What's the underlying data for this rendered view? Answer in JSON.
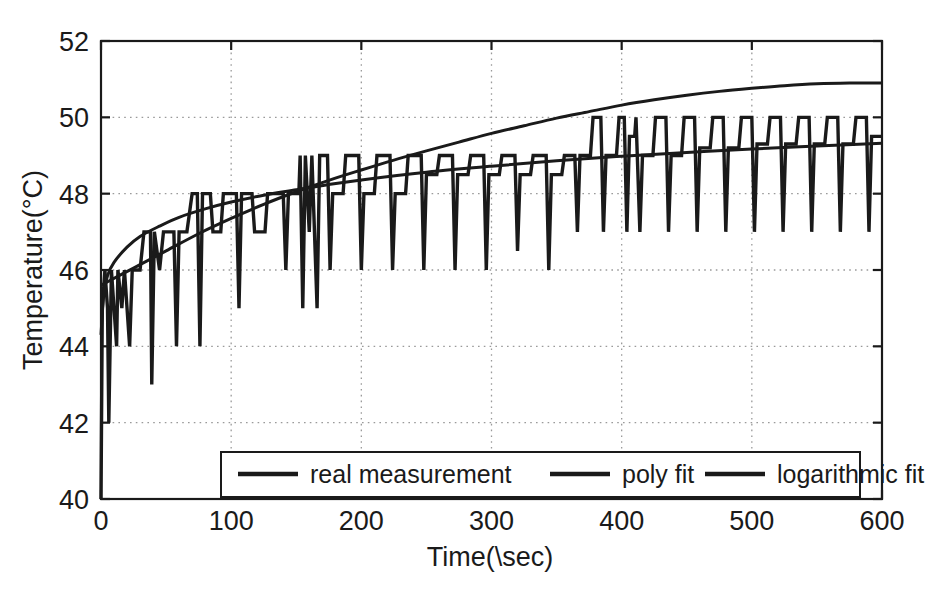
{
  "chart_data": {
    "type": "line",
    "title": "",
    "xlabel": "Time(\\sec)",
    "ylabel": "Temperature(°C)",
    "xlim": [
      0,
      600
    ],
    "ylim": [
      40,
      52
    ],
    "xticks": [
      0,
      100,
      200,
      300,
      400,
      500,
      600
    ],
    "yticks": [
      40,
      42,
      44,
      46,
      48,
      50,
      52
    ],
    "xtick_labels": [
      "0",
      "100",
      "200",
      "300",
      "400",
      "500",
      "600"
    ],
    "ytick_labels": [
      "40",
      "42",
      "44",
      "46",
      "48",
      "50",
      "52"
    ],
    "grid": true,
    "grid_style": "dotted",
    "legend_position": "lower center",
    "line_color": "#1a1a1a",
    "background": "#ffffff",
    "series": [
      {
        "name": "real measurement",
        "style": "square-wave with downward spikes",
        "points": [
          [
            0,
            40.0
          ],
          [
            1,
            45.0
          ],
          [
            3,
            46.0
          ],
          [
            5,
            45.0
          ],
          [
            6,
            42.0
          ],
          [
            8,
            46.0
          ],
          [
            12,
            44.0
          ],
          [
            13,
            46.0
          ],
          [
            16,
            45.0
          ],
          [
            18,
            46.0
          ],
          [
            22,
            44.0
          ],
          [
            24,
            46.0
          ],
          [
            30,
            46.0
          ],
          [
            33,
            47.0
          ],
          [
            38,
            47.0
          ],
          [
            39,
            43.0
          ],
          [
            41,
            47.0
          ],
          [
            45,
            46.0
          ],
          [
            48,
            47.0
          ],
          [
            56,
            47.0
          ],
          [
            58,
            44.0
          ],
          [
            60,
            47.0
          ],
          [
            66,
            47.0
          ],
          [
            70,
            48.0
          ],
          [
            74,
            48.0
          ],
          [
            76,
            44.0
          ],
          [
            78,
            48.0
          ],
          [
            84,
            48.0
          ],
          [
            86,
            47.0
          ],
          [
            92,
            47.0
          ],
          [
            94,
            48.0
          ],
          [
            104,
            48.0
          ],
          [
            106,
            45.0
          ],
          [
            108,
            48.0
          ],
          [
            116,
            48.0
          ],
          [
            118,
            47.0
          ],
          [
            126,
            47.0
          ],
          [
            128,
            48.0
          ],
          [
            140,
            48.0
          ],
          [
            142,
            46.0
          ],
          [
            144,
            48.0
          ],
          [
            152,
            48.0
          ],
          [
            153,
            49.0
          ],
          [
            155,
            45.0
          ],
          [
            157,
            49.0
          ],
          [
            160,
            47.0
          ],
          [
            162,
            49.0
          ],
          [
            166,
            45.0
          ],
          [
            168,
            49.0
          ],
          [
            174,
            49.0
          ],
          [
            176,
            46.0
          ],
          [
            178,
            48.0
          ],
          [
            186,
            48.0
          ],
          [
            188,
            49.0
          ],
          [
            198,
            49.0
          ],
          [
            200,
            46.0
          ],
          [
            202,
            48.0
          ],
          [
            210,
            48.0
          ],
          [
            212,
            49.0
          ],
          [
            222,
            49.0
          ],
          [
            224,
            46.0
          ],
          [
            226,
            48.0
          ],
          [
            234,
            48.0
          ],
          [
            236,
            49.0
          ],
          [
            246,
            49.0
          ],
          [
            248,
            46.0
          ],
          [
            250,
            48.5
          ],
          [
            258,
            48.5
          ],
          [
            260,
            49.0
          ],
          [
            270,
            49.0
          ],
          [
            272,
            46.0
          ],
          [
            274,
            48.5
          ],
          [
            282,
            48.5
          ],
          [
            284,
            49.0
          ],
          [
            294,
            49.0
          ],
          [
            296,
            46.0
          ],
          [
            298,
            48.5
          ],
          [
            306,
            48.5
          ],
          [
            308,
            49.0
          ],
          [
            318,
            49.0
          ],
          [
            320,
            46.5
          ],
          [
            322,
            48.5
          ],
          [
            330,
            48.5
          ],
          [
            332,
            49.0
          ],
          [
            342,
            49.0
          ],
          [
            344,
            46.0
          ],
          [
            346,
            48.5
          ],
          [
            354,
            48.5
          ],
          [
            356,
            49.0
          ],
          [
            364,
            49.0
          ],
          [
            366,
            47.0
          ],
          [
            368,
            49.0
          ],
          [
            376,
            49.0
          ],
          [
            378,
            50.0
          ],
          [
            384,
            50.0
          ],
          [
            386,
            47.0
          ],
          [
            388,
            49.0
          ],
          [
            396,
            49.0
          ],
          [
            398,
            50.0
          ],
          [
            402,
            50.0
          ],
          [
            404,
            47.0
          ],
          [
            406,
            49.5
          ],
          [
            410,
            49.5
          ],
          [
            411,
            50.0
          ],
          [
            414,
            47.0
          ],
          [
            416,
            49.0
          ],
          [
            424,
            49.0
          ],
          [
            426,
            50.0
          ],
          [
            434,
            50.0
          ],
          [
            436,
            47.0
          ],
          [
            438,
            49.0
          ],
          [
            446,
            49.0
          ],
          [
            448,
            50.0
          ],
          [
            456,
            50.0
          ],
          [
            458,
            47.0
          ],
          [
            460,
            49.2
          ],
          [
            468,
            49.2
          ],
          [
            470,
            50.0
          ],
          [
            478,
            50.0
          ],
          [
            480,
            47.0
          ],
          [
            482,
            49.2
          ],
          [
            490,
            49.2
          ],
          [
            492,
            50.0
          ],
          [
            500,
            50.0
          ],
          [
            502,
            47.0
          ],
          [
            504,
            49.3
          ],
          [
            512,
            49.3
          ],
          [
            514,
            50.0
          ],
          [
            522,
            50.0
          ],
          [
            524,
            47.0
          ],
          [
            526,
            49.3
          ],
          [
            534,
            49.3
          ],
          [
            536,
            50.0
          ],
          [
            544,
            50.0
          ],
          [
            546,
            47.0
          ],
          [
            548,
            49.3
          ],
          [
            556,
            49.3
          ],
          [
            558,
            50.0
          ],
          [
            566,
            50.0
          ],
          [
            568,
            47.0
          ],
          [
            570,
            49.3
          ],
          [
            578,
            49.3
          ],
          [
            580,
            50.0
          ],
          [
            588,
            50.0
          ],
          [
            590,
            47.0
          ],
          [
            592,
            49.5
          ],
          [
            600,
            49.5
          ]
        ]
      },
      {
        "name": "poly fit",
        "style": "smooth polynomial curve",
        "points": [
          [
            0,
            45.6
          ],
          [
            25,
            46.05
          ],
          [
            50,
            46.5
          ],
          [
            75,
            46.95
          ],
          [
            100,
            47.35
          ],
          [
            125,
            47.72
          ],
          [
            150,
            48.05
          ],
          [
            175,
            48.35
          ],
          [
            200,
            48.62
          ],
          [
            225,
            48.88
          ],
          [
            250,
            49.12
          ],
          [
            275,
            49.35
          ],
          [
            300,
            49.58
          ],
          [
            325,
            49.78
          ],
          [
            350,
            49.98
          ],
          [
            375,
            50.15
          ],
          [
            400,
            50.32
          ],
          [
            425,
            50.46
          ],
          [
            450,
            50.58
          ],
          [
            475,
            50.68
          ],
          [
            500,
            50.76
          ],
          [
            525,
            50.83
          ],
          [
            550,
            50.88
          ],
          [
            575,
            50.9
          ],
          [
            600,
            50.9
          ]
        ]
      },
      {
        "name": "logarithmic fit",
        "style": "logarithmic curve",
        "points": [
          [
            0,
            44.3
          ],
          [
            2,
            45.3
          ],
          [
            5,
            45.85
          ],
          [
            10,
            46.2
          ],
          [
            20,
            46.6
          ],
          [
            30,
            46.88
          ],
          [
            45,
            47.15
          ],
          [
            60,
            47.38
          ],
          [
            80,
            47.6
          ],
          [
            100,
            47.78
          ],
          [
            125,
            47.96
          ],
          [
            150,
            48.1
          ],
          [
            175,
            48.24
          ],
          [
            200,
            48.36
          ],
          [
            250,
            48.56
          ],
          [
            300,
            48.72
          ],
          [
            350,
            48.86
          ],
          [
            400,
            48.98
          ],
          [
            450,
            49.08
          ],
          [
            500,
            49.17
          ],
          [
            550,
            49.25
          ],
          [
            600,
            49.32
          ]
        ]
      }
    ],
    "legend_entries": [
      "real measurement",
      "poly fit",
      "logarithmic fit"
    ]
  },
  "legend": {
    "items": [
      {
        "label": "real measurement"
      },
      {
        "label": "poly fit"
      },
      {
        "label": "logarithmic fit"
      }
    ]
  },
  "axes": {
    "x_label": "Time(\\sec)",
    "y_label": "Temperature(°C)",
    "x_tick_labels": [
      "0",
      "100",
      "200",
      "300",
      "400",
      "500",
      "600"
    ],
    "y_tick_labels": [
      "40",
      "42",
      "44",
      "46",
      "48",
      "50",
      "52"
    ]
  }
}
